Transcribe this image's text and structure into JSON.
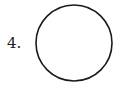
{
  "problem": {
    "number_label": "4."
  },
  "figure": {
    "shape": "circle",
    "stroke_color": "#1a1a1a",
    "fill_color": "#ffffff",
    "center": [
      74,
      43
    ],
    "radius": 38
  }
}
